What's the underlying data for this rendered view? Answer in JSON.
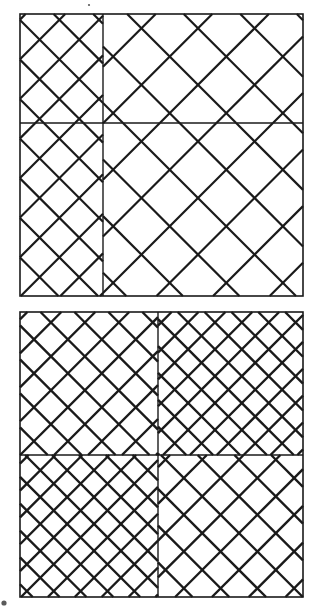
{
  "document": {
    "title": "Two Hatched Squares Diagram",
    "background_color": "#ffffff",
    "stroke_color": "#1a1a1a",
    "canvas": {
      "width": 315,
      "height": 610
    }
  },
  "figures": [
    {
      "id": "square-top",
      "label": "Upper Square",
      "x": 20,
      "y": 14,
      "width": 283,
      "height": 282,
      "border_width": 1.6,
      "center_cross": {
        "vertical_x": 103,
        "horizontal_y": 123,
        "line_width": 1.4
      },
      "quadrants": [
        {
          "name": "top-left",
          "x": 20,
          "y": 14,
          "width": 83,
          "height": 109,
          "hatch_spacing": 28,
          "hatch_width": 2.2,
          "directions": [
            "down-right",
            "down-left"
          ]
        },
        {
          "name": "top-right",
          "x": 103,
          "y": 14,
          "width": 200,
          "height": 109,
          "hatch_spacing": 40,
          "hatch_width": 2.2,
          "directions": [
            "down-right",
            "down-left"
          ]
        },
        {
          "name": "bottom-left",
          "x": 20,
          "y": 123,
          "width": 83,
          "height": 173,
          "hatch_spacing": 28,
          "hatch_width": 2.2,
          "directions": [
            "down-right",
            "down-left"
          ]
        },
        {
          "name": "bottom-right",
          "x": 103,
          "y": 123,
          "width": 200,
          "height": 173,
          "hatch_spacing": 40,
          "hatch_width": 2.2,
          "directions": [
            "down-right",
            "down-left"
          ]
        }
      ]
    },
    {
      "id": "square-bottom",
      "label": "Lower Square",
      "x": 20,
      "y": 312,
      "width": 283,
      "height": 285,
      "border_width": 1.6,
      "center_cross": {
        "vertical_x": 158,
        "horizontal_y": 455,
        "line_width": 1.4
      },
      "quadrants": [
        {
          "name": "top-left",
          "x": 20,
          "y": 312,
          "width": 138,
          "height": 143,
          "hatch_spacing": 24,
          "hatch_width": 2.4,
          "directions": [
            "down-right",
            "down-left"
          ]
        },
        {
          "name": "top-right",
          "x": 158,
          "y": 312,
          "width": 145,
          "height": 143,
          "hatch_spacing": 19,
          "hatch_width": 2.4,
          "directions": [
            "down-right",
            "down-left"
          ]
        },
        {
          "name": "bottom-left",
          "x": 20,
          "y": 455,
          "width": 138,
          "height": 142,
          "hatch_spacing": 19,
          "hatch_width": 2.4,
          "directions": [
            "down-right",
            "down-left"
          ]
        },
        {
          "name": "bottom-right",
          "x": 158,
          "y": 455,
          "width": 145,
          "height": 142,
          "hatch_spacing": 26,
          "hatch_width": 2.4,
          "directions": [
            "down-right",
            "down-left"
          ]
        }
      ]
    }
  ],
  "artifacts": [
    {
      "name": "speck-top",
      "x": 89,
      "y": 5,
      "r": 1.1
    },
    {
      "name": "speck-bottom-left",
      "x": 4,
      "y": 603,
      "r": 2.6
    }
  ]
}
